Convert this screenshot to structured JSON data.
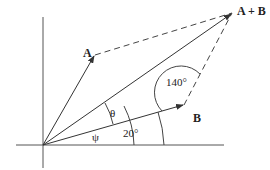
{
  "diagram": {
    "type": "vector-addition-parallelogram",
    "vectors": [
      {
        "label": "A"
      },
      {
        "label": "B"
      },
      {
        "label": "A + B"
      }
    ],
    "angles": {
      "b_to_x_axis": "20°",
      "parallelogram_interior": "140°",
      "theta": "θ",
      "psi": "ψ"
    }
  }
}
